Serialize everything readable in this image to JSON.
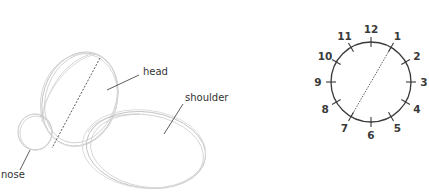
{
  "sketch": {
    "labels": {
      "head": "head",
      "shoulder": "shoulder",
      "nose": "nose"
    },
    "stroke_color": "#bdbdbd",
    "leader_color": "#333333"
  },
  "clock": {
    "numbers": [
      "12",
      "1",
      "2",
      "3",
      "4",
      "5",
      "6",
      "7",
      "8",
      "9",
      "10",
      "11"
    ],
    "axis_from": "1",
    "axis_to": "7",
    "color": "#3a3a3a"
  }
}
